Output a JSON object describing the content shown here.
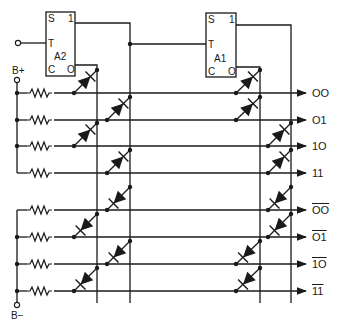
{
  "diagram": {
    "type": "decoder-circuit",
    "flipflops": [
      {
        "id": "A2",
        "label": "A2",
        "pins": {
          "set": "S",
          "one": "1",
          "toggle": "T",
          "clear": "C",
          "zero": "O"
        }
      },
      {
        "id": "A1",
        "label": "A1",
        "pins": {
          "set": "S",
          "one": "1",
          "toggle": "T",
          "clear": "C",
          "zero": "O"
        }
      }
    ],
    "supply": {
      "positive": "B+",
      "negative": "B−"
    },
    "outputs": [
      {
        "label": "OO",
        "inverted": false
      },
      {
        "label": "O1",
        "inverted": false
      },
      {
        "label": "1O",
        "inverted": false
      },
      {
        "label": "11",
        "inverted": false
      },
      {
        "label": "OO",
        "inverted": true
      },
      {
        "label": "O1",
        "inverted": true
      },
      {
        "label": "1O",
        "inverted": true
      },
      {
        "label": "11",
        "inverted": true
      }
    ],
    "colors": {
      "ink": "#1a1a1a",
      "background": "#ffffff"
    }
  }
}
